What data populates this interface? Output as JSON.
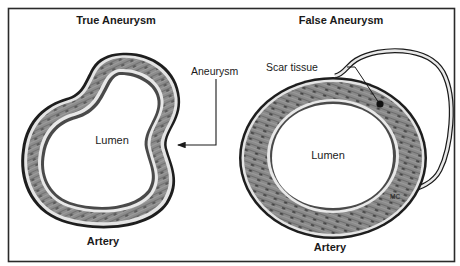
{
  "figure": {
    "panels": [
      {
        "title": "True Aneurysm",
        "lumen_label": "Lumen",
        "vessel_label": "Artery",
        "annotation": {
          "label": "Aneurysm",
          "pointer": "arrow"
        }
      },
      {
        "title": "False Aneurysm",
        "lumen_label": "Lumen",
        "vessel_label": "Artery",
        "annotation": {
          "label": "Scar tissue",
          "pointer": "dot"
        },
        "small_label": "MC"
      }
    ]
  },
  "colors": {
    "frame": "#2a2a2a",
    "wall_dark": "#555555",
    "wall_mid": "#8a8a8a",
    "wall_light": "#e6e6e6",
    "line": "#1a1a1a",
    "background": "#ffffff"
  }
}
